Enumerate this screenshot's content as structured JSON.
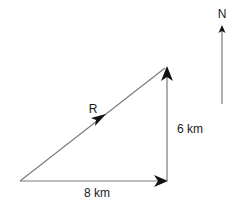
{
  "diagram": {
    "type": "vector-triangle",
    "labels": {
      "north": "N",
      "resultant": "R",
      "vertical_leg": "6 km",
      "horizontal_leg": "8 km"
    },
    "vectors": [
      {
        "name": "east-displacement",
        "magnitude_label": "8 km",
        "direction": "east"
      },
      {
        "name": "north-displacement",
        "magnitude_label": "6 km",
        "direction": "north"
      },
      {
        "name": "resultant",
        "label": "R",
        "direction": "north-east"
      }
    ],
    "colors": {
      "line": "#7a7a7a",
      "arrowhead": "#111111",
      "text": "#1a1a1a"
    }
  }
}
